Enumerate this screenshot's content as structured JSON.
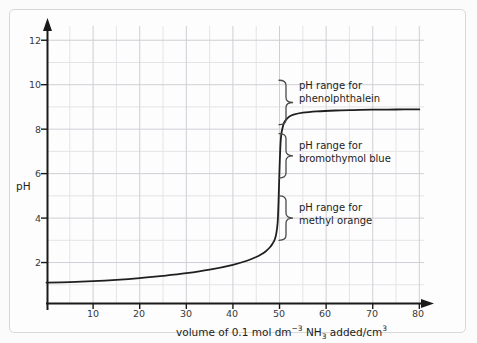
{
  "chart_data": {
    "type": "line",
    "title": "",
    "xlabel_parts": {
      "pre": "volume of 0.1 mol dm",
      "sup1": "−3",
      "mid": " NH",
      "sub1": "3",
      "post": " added/cm",
      "sup2": "3"
    },
    "xlabel": "volume of 0.1 mol dm-3 NH3 added/cm3",
    "ylabel": "pH",
    "xlim": [
      0,
      85
    ],
    "ylim": [
      0,
      12.8
    ],
    "xticks": [
      10,
      20,
      30,
      40,
      50,
      60,
      70,
      80
    ],
    "yticks": [
      2,
      4,
      6,
      8,
      10,
      12
    ],
    "grid": true,
    "grid_x_step": 5,
    "grid_y_step": 1,
    "legend": "none",
    "series": [
      {
        "name": "titration curve",
        "description": "strong acid titrated with 0.1 mol dm-3 NH3; equivalence near 50 cm3",
        "x": [
          0,
          5,
          10,
          15,
          20,
          25,
          30,
          35,
          40,
          43,
          45,
          46,
          47,
          48,
          48.5,
          49,
          49.3,
          49.6,
          49.8,
          50,
          50.2,
          50.4,
          50.7,
          51,
          51.5,
          52,
          53,
          55,
          58,
          62,
          66,
          70,
          75,
          80
        ],
        "y": [
          1.1,
          1.12,
          1.16,
          1.22,
          1.3,
          1.4,
          1.52,
          1.68,
          1.9,
          2.08,
          2.25,
          2.36,
          2.5,
          2.7,
          2.85,
          3.05,
          3.3,
          3.8,
          4.8,
          6.2,
          7.3,
          7.8,
          8.1,
          8.3,
          8.45,
          8.55,
          8.65,
          8.74,
          8.8,
          8.84,
          8.86,
          8.875,
          8.885,
          8.89
        ]
      }
    ],
    "annotations": [
      {
        "id": "phenolphthalein",
        "line1": "pH range for",
        "line2": "phenolphthalein",
        "ph_from": 8.2,
        "ph_to": 10.2
      },
      {
        "id": "bromothymol-blue",
        "line1": "pH range for",
        "line2": "bromothymol blue",
        "ph_from": 5.8,
        "ph_to": 7.8
      },
      {
        "id": "methyl-orange",
        "line1": "pH range for",
        "line2": "methyl orange",
        "ph_from": 3.0,
        "ph_to": 5.0
      }
    ],
    "colors": {
      "curve": "#1f1f1f",
      "axis": "#1a1a1a",
      "grid_minor": "#e2e2e6",
      "grid_major": "#c9c9cf",
      "background": "#fdfdfd",
      "frame": "#d8d8d8",
      "brace": "#4a4a4a",
      "text": "#1c1c1c"
    }
  },
  "axes": {
    "y_title": "pH",
    "y_tick_labels": [
      "12",
      "10",
      "8",
      "6",
      "4",
      "2"
    ],
    "x_tick_labels": [
      "10",
      "20",
      "30",
      "40",
      "50",
      "60",
      "70",
      "80"
    ]
  },
  "annotations_text": {
    "a0_l1": "pH range for",
    "a0_l2": "phenolphthalein",
    "a1_l1": "pH range for",
    "a1_l2": "bromothymol blue",
    "a2_l1": "pH range for",
    "a2_l2": "methyl orange"
  },
  "xlabel": {
    "pre": "volume of 0.1 mol dm",
    "sup1": "−3",
    "mid": " NH",
    "sub1": "3",
    "post": " added/cm",
    "sup2": "3"
  }
}
